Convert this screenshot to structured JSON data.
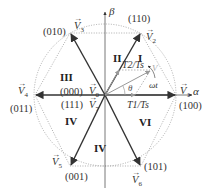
{
  "diagram": {
    "axes": {
      "alpha": "α",
      "beta": "β"
    },
    "vectors": [
      {
        "name": "V1",
        "sub": "1",
        "code": "(100)"
      },
      {
        "name": "V2",
        "sub": "2",
        "code": "(110)"
      },
      {
        "name": "V3",
        "sub": "3",
        "code": "(010)"
      },
      {
        "name": "V4",
        "sub": "4",
        "code": "(011)"
      },
      {
        "name": "V5",
        "sub": "5",
        "code": "(001)"
      },
      {
        "name": "V6",
        "sub": "6",
        "code": "(101)"
      },
      {
        "name": "V0",
        "sub": "0",
        "code": "(000)"
      },
      {
        "name": "V7",
        "sub": "7",
        "code": "(111)"
      }
    ],
    "vector_letter": "V",
    "arrow_glyph": "→",
    "sectors": [
      "I",
      "II",
      "III",
      "IV",
      "IV",
      "VI"
    ],
    "ratios": {
      "t1": "T1/Ts",
      "t2": "T2/Ts"
    },
    "angles": {
      "theta": "θ",
      "omega_t": "ωt"
    },
    "reference_vector": "V",
    "colors": {
      "line": "#333333",
      "dotted": "#999999",
      "reference": "#9a9a9a"
    }
  }
}
